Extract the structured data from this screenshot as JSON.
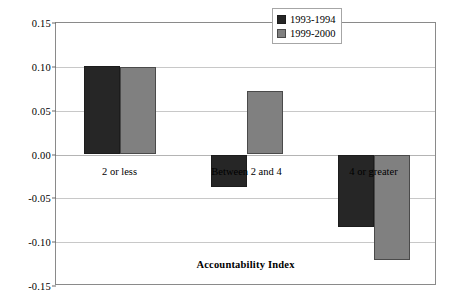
{
  "chart_data": {
    "type": "bar",
    "title": "",
    "subtitle": "",
    "xlabel": "Accountability Index",
    "ylabel": "Standard Deviations from the Average",
    "categories": [
      "2 or less",
      "Between 2 and 4",
      "4 or greater"
    ],
    "series": [
      {
        "name": "1993-1994",
        "color": "#262626",
        "values": [
          0.101,
          -0.037,
          -0.083
        ]
      },
      {
        "name": "1999-2000",
        "color": "#808080",
        "values": [
          0.1,
          0.072,
          -0.12
        ]
      }
    ],
    "ylim": [
      -0.15,
      0.15
    ],
    "yticks": [
      0.15,
      0.1,
      0.05,
      0.0,
      -0.05,
      -0.1,
      -0.15
    ],
    "ytick_labels": [
      "0.15",
      "0.10",
      "0.05",
      "0.00",
      "-0.05",
      "-0.10",
      "-0.15"
    ],
    "grid": true,
    "grid_axis": "y",
    "legend_position": "top-right",
    "zero_line": 0.0,
    "orientation": "vertical",
    "bar_grouping": "grouped"
  },
  "legend": {
    "entries": [
      {
        "label": "1993-1994",
        "swatch": "dark"
      },
      {
        "label": "1999-2000",
        "swatch": "gray"
      }
    ]
  },
  "axes": {
    "x_title": "Accountability Index",
    "y_title": "Standard Deviations from the Average"
  },
  "colors": {
    "series_1993_1994": "#262626",
    "series_1999_2000": "#808080",
    "gridline": "#c8c8c8",
    "frame": "#8a8a8a",
    "background": "#ffffff"
  }
}
